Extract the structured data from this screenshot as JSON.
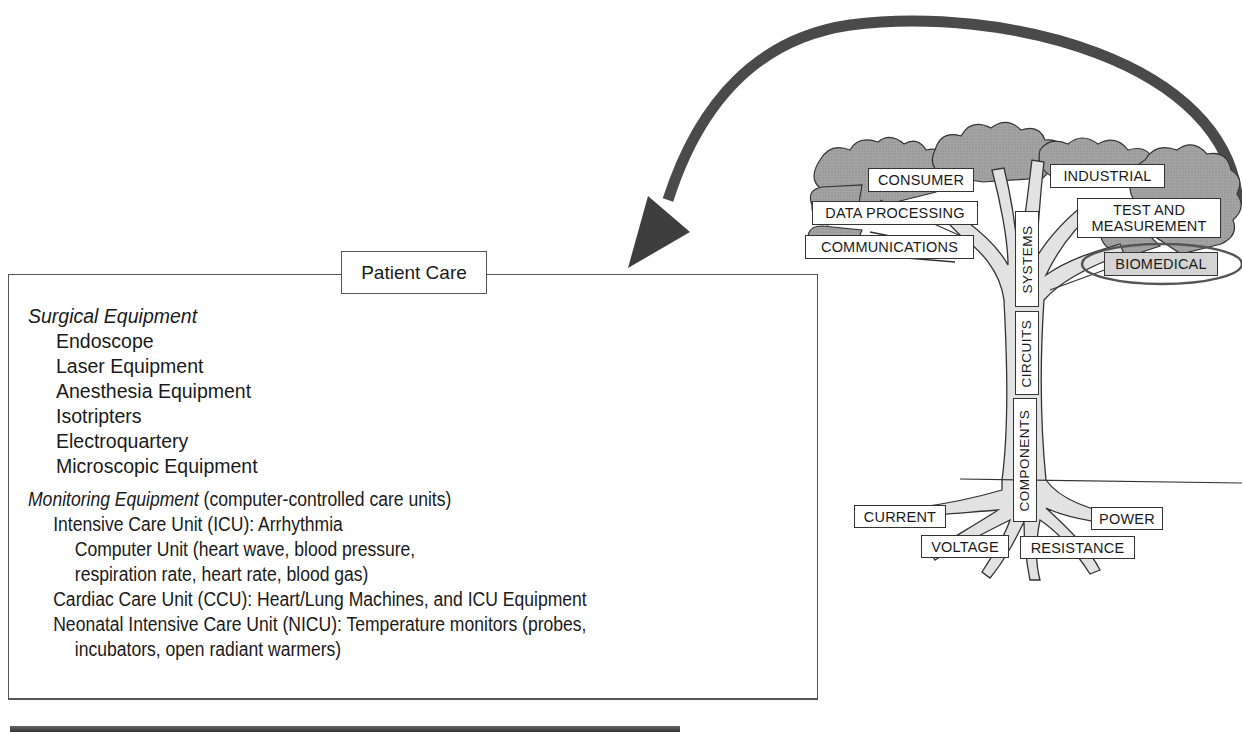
{
  "diagram": {
    "arrow": {
      "from": "biomedical-branch",
      "to": "patient-care-box",
      "color": "#4a4a4a"
    },
    "tree": {
      "canopy_labels": [
        {
          "id": "consumer",
          "text": "CONSUMER"
        },
        {
          "id": "industrial",
          "text": "INDUSTRIAL"
        },
        {
          "id": "data-processing",
          "text": "DATA PROCESSING"
        },
        {
          "id": "test-and-measurement",
          "line1": "TEST AND",
          "line2": "MEASUREMENT"
        },
        {
          "id": "communications",
          "text": "COMMUNICATIONS"
        },
        {
          "id": "biomedical",
          "text": "BIOMEDICAL",
          "highlighted": true
        }
      ],
      "trunk_labels": [
        {
          "id": "systems",
          "text": "SYSTEMS"
        },
        {
          "id": "circuits",
          "text": "CIRCUITS"
        },
        {
          "id": "components",
          "text": "COMPONENTS"
        }
      ],
      "root_labels": [
        {
          "id": "current",
          "text": "CURRENT"
        },
        {
          "id": "power",
          "text": "POWER"
        },
        {
          "id": "voltage",
          "text": "VOLTAGE"
        },
        {
          "id": "resistance",
          "text": "RESISTANCE"
        }
      ],
      "colors": {
        "foliage": "#9a9a9a",
        "trunk": "#e0e0e0",
        "highlight_fill": "#d4d4d4"
      }
    },
    "patient_care": {
      "title": "Patient Care",
      "surgical": {
        "heading": "Surgical Equipment",
        "items": [
          "Endoscope",
          "Laser Equipment",
          "Anesthesia Equipment",
          "Isotripters",
          "Electroquartery",
          "Microscopic Equipment"
        ]
      },
      "monitoring": {
        "heading": "Monitoring Equipment",
        "heading_note": " (computer-controlled care units)",
        "lines": [
          {
            "level": 1,
            "text": "Intensive Care Unit (ICU):  Arrhythmia"
          },
          {
            "level": 2,
            "text": "Computer Unit (heart wave, blood pressure,"
          },
          {
            "level": 2,
            "text": "respiration rate, heart rate, blood gas)"
          },
          {
            "level": 1,
            "text": "Cardiac Care Unit (CCU):  Heart/Lung Machines, and ICU Equipment"
          },
          {
            "level": 1,
            "text": "Neonatal Intensive Care Unit (NICU):  Temperature monitors (probes,"
          },
          {
            "level": 2,
            "text": "incubators, open radiant warmers)"
          }
        ]
      }
    }
  }
}
